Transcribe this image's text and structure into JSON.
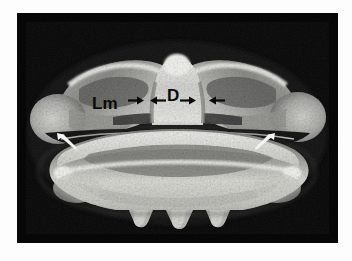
{
  "figure": {
    "kind": "radiograph",
    "modality": "x-ray",
    "panel": {
      "background_color": "#050505",
      "border_color": "#ffffff",
      "left": 17,
      "top": 13,
      "width": 321,
      "height": 230
    },
    "page_background": "#ffffff"
  },
  "annotations": {
    "labels": [
      {
        "id": "lm",
        "text": "Lm",
        "color": "#0b0b0b",
        "x": 75,
        "y": 82,
        "font_size": 17
      },
      {
        "id": "d",
        "text": "D",
        "color": "#0b0b0b",
        "x": 150,
        "y": 74,
        "font_size": 17
      }
    ],
    "black_arrows": [
      {
        "id": "arrow-lm-right",
        "direction": "right",
        "x": 111,
        "y": 87,
        "length": 15,
        "color": "#0a0a0a"
      },
      {
        "id": "arrow-d-left",
        "direction": "left",
        "x": 133,
        "y": 87,
        "length": 15,
        "color": "#0a0a0a"
      },
      {
        "id": "arrow-d-right",
        "direction": "right",
        "x": 163,
        "y": 87,
        "length": 15,
        "color": "#0a0a0a"
      },
      {
        "id": "arrow-lateral-left",
        "direction": "left",
        "x": 192,
        "y": 87,
        "length": 15,
        "color": "#0a0a0a"
      }
    ],
    "white_arrows": [
      {
        "id": "white-arrow-left",
        "direction": "up-left",
        "x": 38,
        "y": 126,
        "length": 22,
        "color": "#f4f4f4"
      },
      {
        "id": "white-arrow-right",
        "direction": "up-right",
        "x": 245,
        "y": 126,
        "length": 22,
        "color": "#f4f4f4"
      }
    ]
  },
  "anatomy": {
    "structures": [
      {
        "name": "left-transverse-process",
        "description": "rounded bulbous lateral process, left"
      },
      {
        "name": "right-transverse-process",
        "description": "rounded bulbous lateral process, right"
      },
      {
        "name": "left-lamina",
        "description": "wing-shaped bright lamina, left"
      },
      {
        "name": "right-lamina",
        "description": "wing-shaped bright lamina, right"
      },
      {
        "name": "dens",
        "description": "central bright triangular odontoid structure"
      },
      {
        "name": "vertebral-body",
        "description": "large lower vertebral body with scalloped inferior border"
      },
      {
        "name": "spinous-projections",
        "description": "three rounded inferior projections"
      }
    ],
    "tone": {
      "bone_bright": "#e8e8e6",
      "bone_mid": "#a8a8a6",
      "bone_dim": "#6a6a68",
      "field_dark": "#0a0a0a"
    }
  }
}
